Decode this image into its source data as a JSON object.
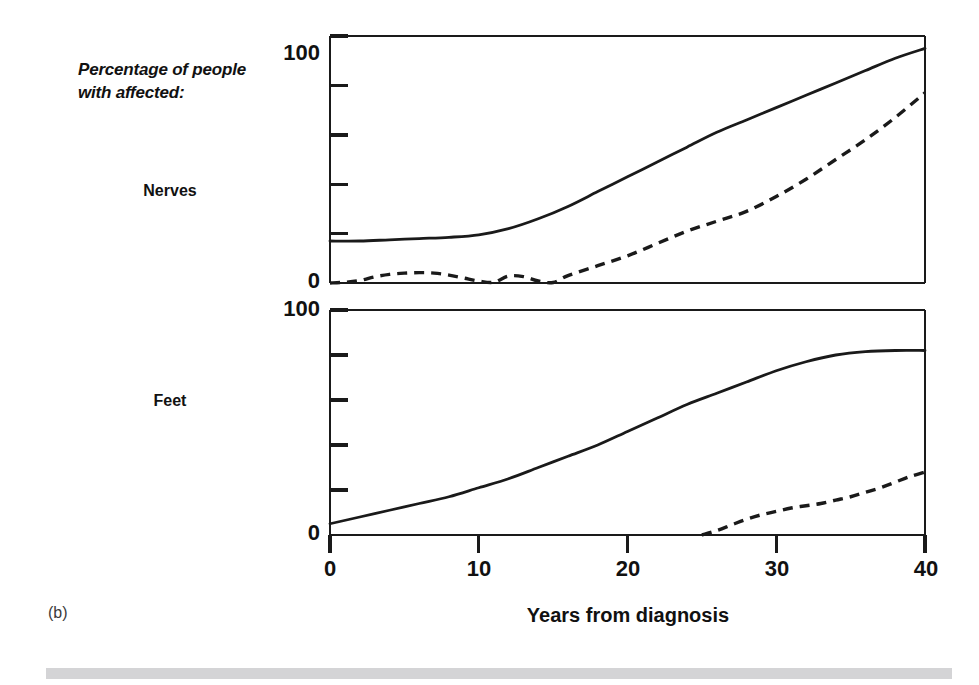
{
  "figure": {
    "panel_id": "(b)",
    "axis_caption_line1": "Percentage of people",
    "axis_caption_line2": "with affected:",
    "xaxis_title": "Years from diagnosis",
    "row_labels": [
      "Nerves",
      "Feet"
    ],
    "ink_color": "#1a1a1a",
    "rule_color": "#d4d4d6"
  },
  "ticks": {
    "y_top": [
      "100",
      "0"
    ],
    "y_bottom": [
      "100",
      "0"
    ],
    "x": [
      "0",
      "10",
      "20",
      "30",
      "40"
    ]
  },
  "chart_data": {
    "type": "line",
    "xlabel": "Years from diagnosis",
    "ylabel": "Percentage of people with affected:",
    "xlim": [
      0,
      40
    ],
    "xticks": [
      0,
      10,
      20,
      30,
      40
    ],
    "grid": false,
    "legend": "none",
    "panels": [
      {
        "name": "Nerves",
        "ylim": [
          0,
          100
        ],
        "yticks": [
          0,
          100
        ],
        "yminor": [
          20,
          40,
          60,
          80
        ],
        "series": [
          {
            "name": "Nerves - solid",
            "style": "solid",
            "x": [
              0,
              2,
              4,
              6,
              8,
              10,
              12,
              14,
              16,
              18,
              20,
              22,
              24,
              26,
              28,
              30,
              32,
              34,
              36,
              38,
              40
            ],
            "values": [
              17,
              17,
              17.5,
              18,
              18.5,
              19.5,
              22,
              26,
              31,
              37,
              43,
              49,
              55,
              61,
              66,
              71,
              76,
              81,
              86,
              91,
              95
            ]
          },
          {
            "name": "Nerves - dashed",
            "style": "dashed",
            "x": [
              0,
              1,
              2,
              3,
              4,
              5,
              6,
              7,
              8,
              9,
              10,
              11,
              12,
              13,
              14,
              15,
              16,
              18,
              20,
              22,
              24,
              26,
              28,
              30,
              32,
              34,
              36,
              38,
              40
            ],
            "values": [
              0,
              0.3,
              1,
              2.5,
              3.5,
              4,
              4.2,
              4,
              3.2,
              2,
              0.8,
              0.3,
              2.8,
              2.6,
              0.8,
              0.2,
              3,
              7,
              11,
              16,
              21,
              25,
              29,
              35,
              42,
              50,
              58,
              67,
              77
            ]
          }
        ]
      },
      {
        "name": "Feet",
        "ylim": [
          0,
          100
        ],
        "yticks": [
          0,
          100
        ],
        "yminor": [
          20,
          40,
          60,
          80
        ],
        "series": [
          {
            "name": "Feet - solid",
            "style": "solid",
            "x": [
              0,
              2,
              4,
              6,
              8,
              10,
              12,
              14,
              16,
              18,
              20,
              22,
              24,
              26,
              28,
              30,
              32,
              34,
              36,
              38,
              40
            ],
            "values": [
              5,
              8,
              11,
              14,
              17,
              21,
              25,
              30,
              35,
              40,
              46,
              52,
              58,
              63,
              68,
              73,
              77,
              80,
              81.5,
              82,
              82
            ]
          },
          {
            "name": "Feet - dashed",
            "style": "dashed",
            "x": [
              25,
              26,
              27,
              28,
              29,
              30,
              31,
              32,
              33,
              34,
              35,
              36,
              37,
              38,
              39,
              40
            ],
            "values": [
              0,
              2,
              4.5,
              7,
              9,
              10.5,
              12,
              13,
              14,
              15.5,
              17,
              19,
              21,
              23.5,
              26,
              28
            ]
          }
        ]
      }
    ]
  }
}
